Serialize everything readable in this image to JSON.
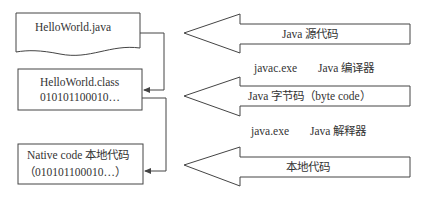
{
  "boxes": [
    {
      "id": "source",
      "lines": [
        "HelloWorld.java"
      ]
    },
    {
      "id": "bytecode",
      "lines": [
        "HelloWorld.class",
        "010101100010…"
      ]
    },
    {
      "id": "native",
      "lines": [
        "Native code 本地代码",
        "（010101100010…）"
      ]
    }
  ],
  "arrows": [
    {
      "label": "Java 源代码"
    },
    {
      "label": "Java 字节码（byte code）"
    },
    {
      "label": "本地代码"
    }
  ],
  "tools": [
    {
      "exe": "javac.exe",
      "desc": "Java 编译器"
    },
    {
      "exe": "java.exe",
      "desc": "Java 解释器"
    }
  ],
  "colors": {
    "stroke": "#444444",
    "text": "#333333",
    "background": "#ffffff"
  }
}
